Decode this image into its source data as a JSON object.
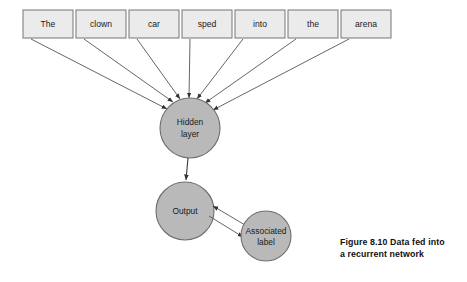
{
  "figure": {
    "caption_line_1": "Figure 8.10    Data fed into",
    "caption_line_2": "a recurrent network",
    "background_color": "#ffffff"
  },
  "input_sequence": {
    "label": "sentence-tokens",
    "box_fill_color": "#ebebeb",
    "box_border_color": "#808080",
    "tokens": [
      {
        "text": "The",
        "x": 23,
        "y": 10,
        "w": 50,
        "h": 28
      },
      {
        "text": "clown",
        "x": 76,
        "y": 10,
        "w": 50,
        "h": 28
      },
      {
        "text": "car",
        "x": 129,
        "y": 10,
        "w": 50,
        "h": 28
      },
      {
        "text": "sped",
        "x": 182,
        "y": 10,
        "w": 50,
        "h": 28
      },
      {
        "text": "into",
        "x": 235,
        "y": 10,
        "w": 50,
        "h": 28
      },
      {
        "text": "the",
        "x": 288,
        "y": 10,
        "w": 50,
        "h": 28
      },
      {
        "text": "arena",
        "x": 341,
        "y": 10,
        "w": 50,
        "h": 28
      }
    ]
  },
  "nodes": {
    "fill_color": "#b9b9b9",
    "border_color": "#6e6e6e",
    "hidden_layer": {
      "line_1": "Hidden",
      "line_2": "layer",
      "cx": 190,
      "cy": 128,
      "r": 30
    },
    "output": {
      "line_1": "Output",
      "line_2": "",
      "cx": 185,
      "cy": 211,
      "r": 29
    },
    "associated_label": {
      "line_1": "Associated",
      "line_2": "label",
      "cx": 266,
      "cy": 236,
      "r": 25
    }
  },
  "edges": {
    "stroke_color": "#555555",
    "input_to_hidden_count": 7,
    "hidden_to_output": "directed-down",
    "output_to_label": "bidirectional-pair"
  }
}
